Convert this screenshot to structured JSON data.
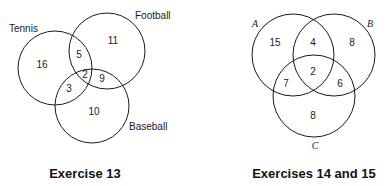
{
  "figures": [
    {
      "caption": "Exercise 13",
      "sets": [
        {
          "name": "Tennis"
        },
        {
          "name": "Football"
        },
        {
          "name": "Baseball"
        }
      ],
      "regions": {
        "tennis_only": "16",
        "football_only": "11",
        "baseball_only": "10",
        "tennis_football": "5",
        "tennis_baseball": "3",
        "football_baseball": "9",
        "all_three": "2"
      }
    },
    {
      "caption": "Exercises 14 and 15",
      "sets": [
        {
          "name": "A"
        },
        {
          "name": "B"
        },
        {
          "name": "C"
        }
      ],
      "regions": {
        "a_only": "15",
        "b_only": "8",
        "c_only": "8",
        "a_b": "4",
        "a_c": "7",
        "b_c": "6",
        "all_three": "2"
      }
    }
  ]
}
